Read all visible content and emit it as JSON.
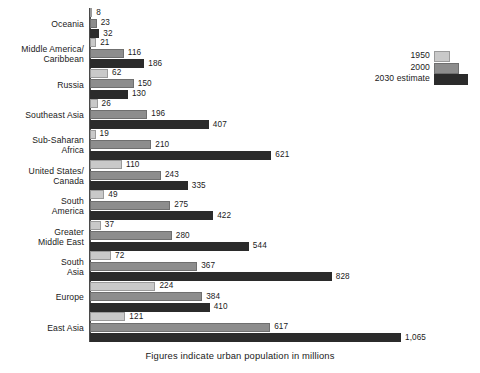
{
  "chart_data": {
    "type": "bar",
    "orientation": "horizontal",
    "title": "",
    "caption": "Figures indicate urban population in millions",
    "xlabel": "",
    "ylabel": "",
    "xlim": [
      0,
      1065
    ],
    "grid": false,
    "value_labels": true,
    "legend_position": "top-right",
    "categories": [
      "Oceania",
      "Middle America/\nCaribbean",
      "Russia",
      "Southeast Asia",
      "Sub-Saharan\nAfrica",
      "United States/\nCanada",
      "South\nAmerica",
      "Greater\nMiddle East",
      "South\nAsia",
      "Europe",
      "East Asia"
    ],
    "series": [
      {
        "name": "1950",
        "color": "#c9c9c9",
        "values": [
          8,
          21,
          62,
          26,
          19,
          110,
          49,
          37,
          72,
          224,
          121
        ],
        "labels": [
          "8",
          "21",
          "62",
          "26",
          "19",
          "110",
          "49",
          "37",
          "72",
          "224",
          "121"
        ]
      },
      {
        "name": "2000",
        "color": "#8d8d8d",
        "values": [
          23,
          116,
          150,
          196,
          210,
          243,
          275,
          280,
          367,
          384,
          617
        ],
        "labels": [
          "23",
          "116",
          "150",
          "196",
          "210",
          "243",
          "275",
          "280",
          "367",
          "384",
          "617"
        ]
      },
      {
        "name": "2030 estimate",
        "color": "#2b2b2b",
        "values": [
          32,
          186,
          130,
          407,
          621,
          335,
          422,
          544,
          828,
          410,
          1065
        ],
        "labels": [
          "32",
          "186",
          "130",
          "407",
          "621",
          "335",
          "422",
          "544",
          "828",
          "410",
          "1,065"
        ]
      }
    ]
  },
  "legend": {
    "entries": [
      {
        "label": "1950",
        "color": "#c9c9c9"
      },
      {
        "label": "2000",
        "color": "#8d8d8d"
      },
      {
        "label": "2030 estimate",
        "color": "#2b2b2b"
      }
    ]
  },
  "caption": {
    "text": "Figures indicate urban population in millions"
  },
  "axis": {
    "baseline_color": "#4a4a4a"
  }
}
